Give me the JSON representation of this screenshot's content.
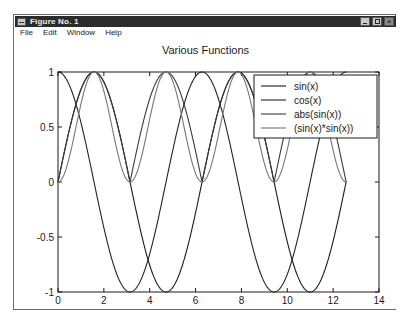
{
  "window": {
    "title": "Figure No. 1",
    "sysmenu_icon": "system-menu-icon",
    "buttons": {
      "minimize": "minimize-icon",
      "maximize": "maximize-icon",
      "close": "close-icon"
    }
  },
  "menubar": {
    "items": [
      {
        "label": "File"
      },
      {
        "label": "Edit"
      },
      {
        "label": "Window"
      },
      {
        "label": "Help"
      }
    ]
  },
  "chart_data": {
    "type": "line",
    "title": "Various Functions",
    "xlabel": "x - (Radians)",
    "ylabel": "",
    "xlim": [
      0,
      14
    ],
    "ylim": [
      -1,
      1
    ],
    "xticks": [
      0,
      2,
      4,
      6,
      8,
      10,
      12,
      14
    ],
    "xticklabels": [
      "0",
      "2",
      "4",
      "6",
      "8",
      "10",
      "12",
      "14"
    ],
    "yticks": [
      -1,
      -0.5,
      0,
      0.5,
      1
    ],
    "yticklabels": [
      "-1",
      "-0.5",
      "0",
      "0.5",
      "1"
    ],
    "grid": false,
    "legend_position": "upper right",
    "x_domain": [
      0,
      12.566
    ],
    "series": [
      {
        "name": "sin(x)",
        "expr": "sin(x)",
        "color": "#1a1a1a",
        "linewidth": 1.1,
        "x": [
          0,
          0.785,
          1.571,
          2.356,
          3.142,
          3.927,
          4.712,
          5.498,
          6.283,
          7.069,
          7.854,
          8.639,
          9.425,
          10.21,
          10.996,
          11.781,
          12.566
        ],
        "y": [
          0,
          0.707,
          1,
          0.707,
          0,
          -0.707,
          -1,
          -0.707,
          0,
          0.707,
          1,
          0.707,
          0,
          -0.707,
          -1,
          -0.707,
          0
        ]
      },
      {
        "name": "cos(x)",
        "expr": "cos(x)",
        "color": "#242424",
        "linewidth": 1.1,
        "x": [
          0,
          0.785,
          1.571,
          2.356,
          3.142,
          3.927,
          4.712,
          5.498,
          6.283,
          7.069,
          7.854,
          8.639,
          9.425,
          10.21,
          10.996,
          11.781,
          12.566
        ],
        "y": [
          1,
          0.707,
          0,
          -0.707,
          -1,
          -0.707,
          0,
          0.707,
          1,
          0.707,
          0,
          -0.707,
          -1,
          -0.707,
          0,
          0.707,
          1
        ]
      },
      {
        "name": "abs(sin(x))",
        "expr": "abs(sin(x))",
        "color": "#3a3a3a",
        "linewidth": 1.1,
        "x": [
          0,
          0.785,
          1.571,
          2.356,
          3.142,
          3.927,
          4.712,
          5.498,
          6.283,
          7.069,
          7.854,
          8.639,
          9.425,
          10.21,
          10.996,
          11.781,
          12.566
        ],
        "y": [
          0,
          0.707,
          1,
          0.707,
          0,
          0.707,
          1,
          0.707,
          0,
          0.707,
          1,
          0.707,
          0,
          0.707,
          1,
          0.707,
          0
        ]
      },
      {
        "name": "(sin(x)*sin(x))",
        "expr": "sin(x)*sin(x)",
        "color": "#767676",
        "linewidth": 1.1,
        "x": [
          0,
          0.785,
          1.571,
          2.356,
          3.142,
          3.927,
          4.712,
          5.498,
          6.283,
          7.069,
          7.854,
          8.639,
          9.425,
          10.21,
          10.996,
          11.781,
          12.566
        ],
        "y": [
          0,
          0.5,
          1,
          0.5,
          0,
          0.5,
          1,
          0.5,
          0,
          0.5,
          1,
          0.5,
          0,
          0.5,
          1,
          0.5,
          0
        ]
      }
    ]
  }
}
